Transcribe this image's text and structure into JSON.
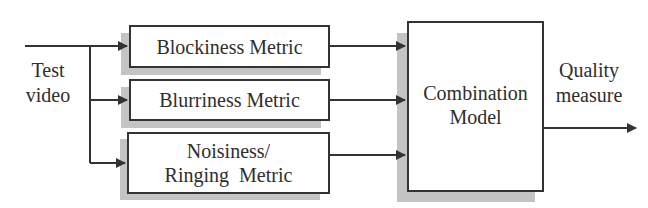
{
  "diagram": {
    "input": {
      "line1": "Test",
      "line2": "video"
    },
    "metrics": [
      {
        "line1": "Blockiness Metric"
      },
      {
        "line1": "Blurriness Metric"
      },
      {
        "line1": "Noisiness/",
        "line2": "Ringing  Metric"
      }
    ],
    "combiner": {
      "line1": "Combination",
      "line2": "Model"
    },
    "output": {
      "line1": "Quality",
      "line2": "measure"
    },
    "colors": {
      "line": "#333333",
      "shadow": "#c4c4c4",
      "box_fill": "#ffffff"
    }
  }
}
